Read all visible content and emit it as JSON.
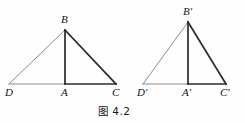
{
  "figure": {
    "caption": "图 4.2",
    "background_color": "#fefefe",
    "stroke_dark": "#2b2b2b",
    "stroke_light": "#8c8c8c",
    "label_color": "#151515",
    "triangles": [
      {
        "name": "left-triangle",
        "vertices": {
          "D": {
            "label": "D",
            "x": 9,
            "y": 84
          },
          "A": {
            "label": "A",
            "x": 65,
            "y": 84
          },
          "C": {
            "label": "C",
            "x": 116,
            "y": 84
          },
          "B": {
            "label": "B",
            "x": 65,
            "y": 30
          }
        },
        "edges": [
          {
            "name": "DB",
            "from": "D",
            "to": "B",
            "weight": "light"
          },
          {
            "name": "DA",
            "from": "D",
            "to": "A",
            "weight": "light"
          },
          {
            "name": "AC",
            "from": "A",
            "to": "C",
            "weight": "dark"
          },
          {
            "name": "BC",
            "from": "B",
            "to": "C",
            "weight": "dark"
          },
          {
            "name": "BA",
            "from": "B",
            "to": "A",
            "weight": "dark"
          }
        ]
      },
      {
        "name": "right-triangle",
        "vertices": {
          "Dp": {
            "label": "D'",
            "x": 143,
            "y": 84
          },
          "Ap": {
            "label": "A'",
            "x": 188,
            "y": 84
          },
          "Cp": {
            "label": "C'",
            "x": 226,
            "y": 84
          },
          "Bp": {
            "label": "B'",
            "x": 188,
            "y": 22
          }
        },
        "edges": [
          {
            "name": "DpBp",
            "from": "Dp",
            "to": "Bp",
            "weight": "light"
          },
          {
            "name": "DpAp",
            "from": "Dp",
            "to": "Ap",
            "weight": "light"
          },
          {
            "name": "ApCp",
            "from": "Ap",
            "to": "Cp",
            "weight": "dark"
          },
          {
            "name": "BpCp",
            "from": "Bp",
            "to": "Cp",
            "weight": "dark"
          },
          {
            "name": "BpAp",
            "from": "Bp",
            "to": "Ap",
            "weight": "dark"
          }
        ]
      }
    ],
    "labels": [
      {
        "name": "vertex-label-B",
        "text": "B",
        "x": 61,
        "y": 14
      },
      {
        "name": "vertex-label-D",
        "text": "D",
        "x": 5,
        "y": 87
      },
      {
        "name": "vertex-label-A",
        "text": "A",
        "x": 61,
        "y": 87
      },
      {
        "name": "vertex-label-C",
        "text": "C",
        "x": 112,
        "y": 87
      },
      {
        "name": "vertex-label-Bp",
        "text": "B'",
        "x": 183,
        "y": 6
      },
      {
        "name": "vertex-label-Dp",
        "text": "D'",
        "x": 137,
        "y": 87
      },
      {
        "name": "vertex-label-Ap",
        "text": "A'",
        "x": 182,
        "y": 87
      },
      {
        "name": "vertex-label-Cp",
        "text": "C'",
        "x": 220,
        "y": 87
      }
    ],
    "caption_pos": {
      "x": 98,
      "y": 103
    }
  }
}
